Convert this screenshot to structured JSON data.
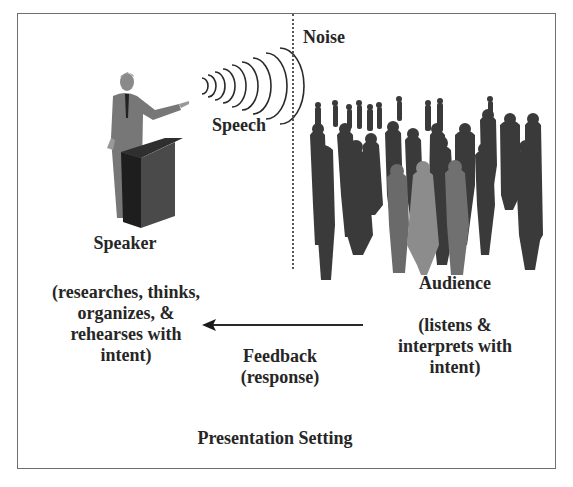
{
  "diagram": {
    "title": "Presentation Setting",
    "noise_label": "Noise",
    "speech_label": "Speech",
    "speaker": {
      "label": "Speaker",
      "description_lines": [
        "(researches, thinks,",
        "organizes, &",
        "rehearses with",
        "intent)"
      ]
    },
    "audience": {
      "label": "Audience",
      "description_lines": [
        "(listens &",
        "interprets with",
        "intent)"
      ]
    },
    "feedback": {
      "label": "Feedback",
      "sublabel": "(response)",
      "arrow_direction": "audience-to-speaker"
    },
    "icons": {
      "speaker": "speaker-at-podium-icon",
      "speech_waves": "sound-waves-icon",
      "audience": "crowd-silhouette-icon",
      "feedback_arrow": "arrow-left-icon"
    },
    "colors": {
      "frame": "#6f6f6f",
      "text": "#262626",
      "crowd_dark": "#3a3a3a",
      "crowd_light": "#8c8c8c",
      "crowd_mid": "#6a6a6a"
    }
  }
}
